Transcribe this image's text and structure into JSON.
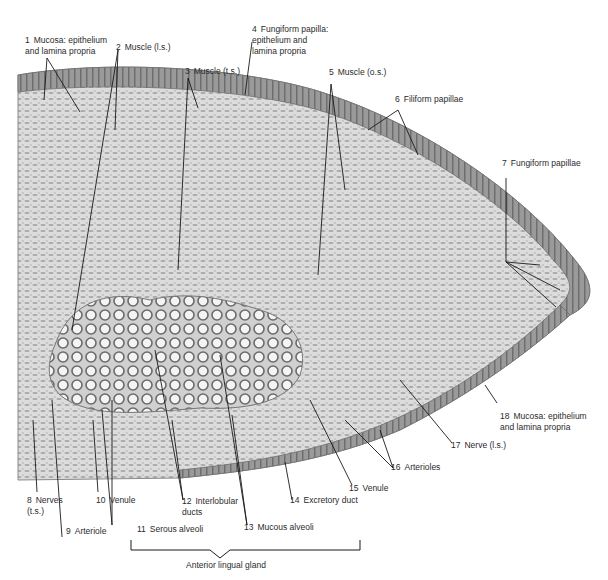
{
  "figure": {
    "palette": {
      "tissue_light": "#d9d9d9",
      "tissue_mid": "#b5b5b5",
      "tissue_dark": "#7f7f7f",
      "epithelium": "#8a8a8a",
      "line": "#1a1a1a",
      "text": "#2b2b2b"
    }
  },
  "labels": [
    {
      "num": "1",
      "text": "Mucosa: epithelium\nand lamina propria"
    },
    {
      "num": "2",
      "text": "Muscle (l.s.)"
    },
    {
      "num": "3",
      "text": "Muscle (t.s.)"
    },
    {
      "num": "4",
      "text": "Fungiform papilla:\nepithelium and\nlamina propria"
    },
    {
      "num": "5",
      "text": "Muscle (o.s.)"
    },
    {
      "num": "6",
      "text": "Filiform papillae"
    },
    {
      "num": "7",
      "text": "Fungiform papillae"
    },
    {
      "num": "8",
      "text": "Nerves\n(t.s.)"
    },
    {
      "num": "9",
      "text": "Arteriole"
    },
    {
      "num": "10",
      "text": "Venule"
    },
    {
      "num": "11",
      "text": "Serous alveoli"
    },
    {
      "num": "12",
      "text": "Interlobular\nducts"
    },
    {
      "num": "13",
      "text": "Mucous alveoli"
    },
    {
      "num": "14",
      "text": "Excretory duct"
    },
    {
      "num": "15",
      "text": "Venule"
    },
    {
      "num": "16",
      "text": "Arterioles"
    },
    {
      "num": "17",
      "text": "Nerve (l.s.)"
    },
    {
      "num": "18",
      "text": "Mucosa: epithelium\nand lamina propria"
    }
  ],
  "bracket_label": "Anterior lingual gland"
}
